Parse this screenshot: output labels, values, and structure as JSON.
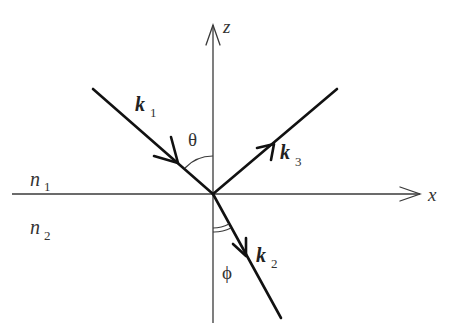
{
  "diagram": {
    "axes": {
      "x_label": "x",
      "z_label": "z"
    },
    "media": {
      "upper": {
        "symbol": "n",
        "subscript": "1"
      },
      "lower": {
        "symbol": "n",
        "subscript": "2"
      }
    },
    "rays": [
      {
        "id": "incident",
        "symbol": "k",
        "subscript": "1",
        "direction": "toward origin from upper-left"
      },
      {
        "id": "reflected",
        "symbol": "k",
        "subscript": "3",
        "direction": "away from origin to upper-right"
      },
      {
        "id": "transmitted",
        "symbol": "k",
        "subscript": "2",
        "direction": "away from origin to lower-right"
      }
    ],
    "angles": {
      "incidence": "θ",
      "refraction": "ϕ"
    },
    "colors": {
      "ray": "#111111",
      "axis": "#3a3a3a",
      "text": "#333333",
      "background": "#ffffff"
    }
  }
}
